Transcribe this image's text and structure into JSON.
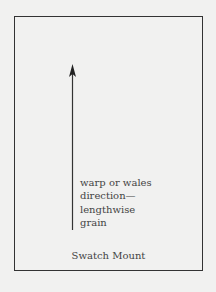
{
  "diagram": {
    "title": "Swatch Mount",
    "arrow_label_lines": [
      "warp or wales",
      "direction—",
      "lengthwise",
      "grain"
    ],
    "arrow_direction": "up",
    "colors": {
      "background": "#f1f1f0",
      "border": "#333333",
      "text": "#444444"
    }
  }
}
